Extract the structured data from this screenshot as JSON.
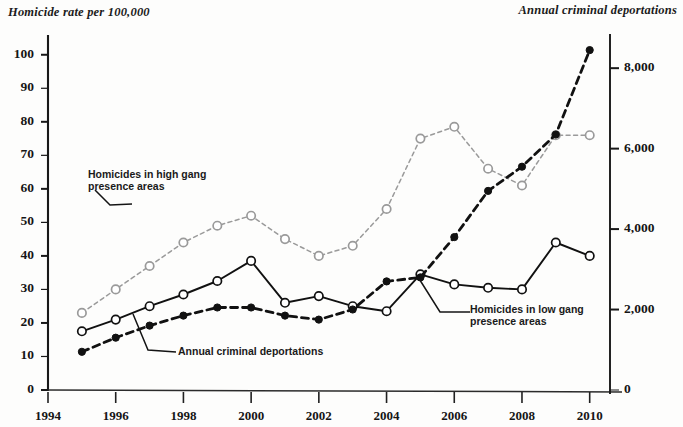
{
  "chart_data": {
    "type": "line",
    "title": "",
    "subtitle": "",
    "ylabel": "Homicide rate per 100,000",
    "ylabel_right": "Annual criminal deportations",
    "xlabel": "",
    "grid": false,
    "legend_position": "inline-annotations",
    "x": [
      1995,
      1996,
      1997,
      1998,
      1999,
      2000,
      2001,
      2002,
      2003,
      2004,
      2005,
      2006,
      2007,
      2008,
      2009,
      2010
    ],
    "xlim": [
      1994,
      2010.6
    ],
    "ylim": [
      0,
      105
    ],
    "ylim_right": [
      0,
      8750
    ],
    "xticks": [
      "1994",
      "1996",
      "1998",
      "2000",
      "2002",
      "2004",
      "2006",
      "2008",
      "2010"
    ],
    "xtick_values": [
      1994,
      1996,
      1998,
      2000,
      2002,
      2004,
      2006,
      2008,
      2010
    ],
    "yticks_left": [
      "0",
      "10",
      "20",
      "30",
      "40",
      "50",
      "60",
      "70",
      "80",
      "90",
      "100"
    ],
    "ytick_left_values": [
      0,
      10,
      20,
      30,
      40,
      50,
      60,
      70,
      80,
      90,
      100
    ],
    "yticks_right": [
      "0",
      "2,000",
      "4,000",
      "6,000",
      "8,000"
    ],
    "ytick_right_values": [
      0,
      2000,
      4000,
      6000,
      8000
    ],
    "series": [
      {
        "name": "Homicides in high gang presence areas",
        "axis": "left",
        "marker": "open-circle",
        "line_style": "dotted",
        "color": "#9a9a9a",
        "values": [
          23,
          30,
          37,
          44,
          49,
          52,
          45,
          40,
          43,
          54,
          75,
          78.5,
          66,
          61,
          76,
          76
        ]
      },
      {
        "name": "Homicides in low gang presence areas",
        "axis": "left",
        "marker": "open-circle",
        "line_style": "solid",
        "color": "#111111",
        "values": [
          17.5,
          21,
          25,
          28.5,
          32.5,
          38.5,
          26,
          28,
          25,
          23.5,
          34.5,
          31.5,
          30.5,
          30,
          44,
          40
        ]
      },
      {
        "name": "Annual criminal deportations",
        "axis": "right",
        "marker": "filled-circle",
        "line_style": "dashed",
        "color": "#111111",
        "values": [
          950,
          1300,
          1600,
          1850,
          2050,
          2050,
          1850,
          1750,
          2000,
          2700,
          2800,
          3800,
          4950,
          5550,
          6350,
          8450
        ]
      }
    ],
    "annotations": [
      {
        "id": "annot-high-gang",
        "text_line1": "Homicides in high gang",
        "text_line2": "presence areas"
      },
      {
        "id": "annot-low-gang",
        "text_line1": "Homicides in low gang",
        "text_line2": "presence areas"
      },
      {
        "id": "annot-deportations",
        "text_line1": "Annual criminal deportations",
        "text_line2": ""
      }
    ]
  }
}
